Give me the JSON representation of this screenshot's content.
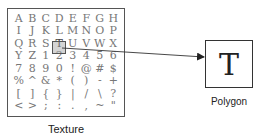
{
  "texture": {
    "label": "Texture",
    "rows": [
      [
        "A",
        "B",
        "C",
        "D",
        "E",
        "F",
        "G",
        "H"
      ],
      [
        "I",
        "J",
        "K",
        "L",
        "M",
        "N",
        "O",
        "P"
      ],
      [
        "Q",
        "R",
        "S",
        "T",
        "U",
        "V",
        "W",
        "X"
      ],
      [
        "Y",
        "Z",
        "1",
        "2",
        "3",
        "4",
        "5",
        "6"
      ],
      [
        "7",
        "8",
        "9",
        "0",
        "!",
        "@",
        "#",
        "$"
      ],
      [
        "%",
        "^",
        "&",
        "*",
        "(",
        ")",
        "-",
        "+"
      ],
      [
        "[",
        "]",
        "{",
        "}",
        "|",
        "/",
        "\\",
        "?"
      ],
      [
        "<",
        ">",
        ";",
        ":",
        ".",
        ",",
        "~",
        "\""
      ]
    ],
    "selected_glyph": "T",
    "selected_row": 2,
    "selected_col": 3
  },
  "polygon": {
    "label": "Polygon",
    "glyph": "T"
  },
  "colors": {
    "border": "#555555",
    "highlight_fill": "#a0a0a0",
    "glyph_text": "#777777",
    "arrow": "#333333"
  }
}
